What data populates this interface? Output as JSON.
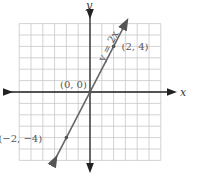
{
  "chart_data": {
    "type": "line",
    "title": "",
    "equation": "y = 2x",
    "xlabel": "x",
    "ylabel": "y",
    "xlim": [
      -6,
      6
    ],
    "ylim": [
      -6,
      6
    ],
    "grid": true,
    "series": [
      {
        "name": "y = 2x",
        "x": [
          -3,
          -2,
          0,
          2,
          3
        ],
        "y": [
          -6,
          -4,
          0,
          4,
          6
        ]
      }
    ],
    "points": [
      {
        "label": "(2, 4)",
        "x": 2,
        "y": 4
      },
      {
        "label": "(0, 0)",
        "x": 0,
        "y": 0
      },
      {
        "label": "(−2, −4)",
        "x": -2,
        "y": -4
      }
    ],
    "annotations": [
      "y = 2x"
    ]
  }
}
